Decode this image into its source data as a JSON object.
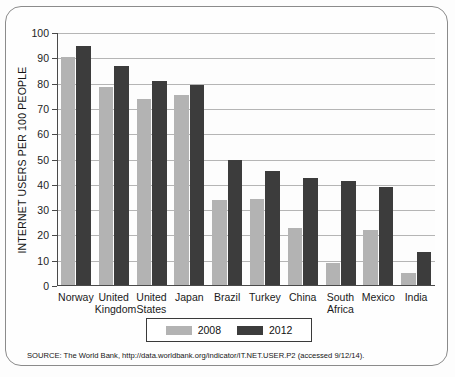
{
  "chart_data": {
    "type": "bar",
    "title": "",
    "xlabel": "",
    "ylabel": "INTERNET USERS PER 100 PEOPLE",
    "ylim": [
      0,
      100
    ],
    "ytick_step": 10,
    "yticks": [
      100,
      90,
      80,
      70,
      60,
      50,
      40,
      30,
      20,
      10,
      0
    ],
    "grid": "horizontal",
    "legend_position": "bottom-center",
    "categories": [
      "Norway",
      "United\nKingdom",
      "United\nStates",
      "Japan",
      "Brazil",
      "Turkey",
      "China",
      "South\nAfrica",
      "Mexico",
      "India"
    ],
    "series": [
      {
        "name": "2008",
        "color": "#b3b3b3",
        "values": [
          90.5,
          78.5,
          74.0,
          75.5,
          34.0,
          34.5,
          23.0,
          9.0,
          22.0,
          5.0
        ]
      },
      {
        "name": "2012",
        "color": "#3c3c3c",
        "values": [
          95.0,
          87.0,
          81.0,
          79.5,
          50.0,
          45.5,
          42.5,
          41.5,
          39.0,
          13.5
        ]
      }
    ],
    "source": "SOURCE: The World Bank, http://data.worldbank.org/indicator/IT.NET.USER.P2 (accessed 9/12/14)."
  },
  "colors": {
    "series_2008": "#b3b3b3",
    "series_2012": "#3c3c3c",
    "axis": "#4a4a4a",
    "gridline": "#b5b5b5",
    "frame": "#8b8b8b",
    "background": "#fdfdfd"
  }
}
